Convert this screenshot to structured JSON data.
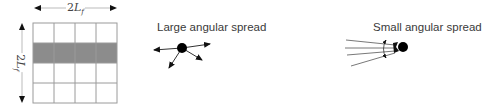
{
  "figure": {
    "grid": {
      "rows": 4,
      "cols": 4,
      "shaded_row_index": 1,
      "shade_color": "#8c8c8c",
      "line_color": "#9a9a9a"
    },
    "dimensions": {
      "horizontal": {
        "prefix": "2",
        "symbol": "L",
        "subscript": "f"
      },
      "vertical": {
        "prefix": "2",
        "symbol": "L",
        "subscript": "f"
      }
    },
    "panels": [
      {
        "label": "Large angular spread",
        "arrow_count": 4
      },
      {
        "label": "Small angular spread",
        "ray_count": 4
      }
    ]
  }
}
